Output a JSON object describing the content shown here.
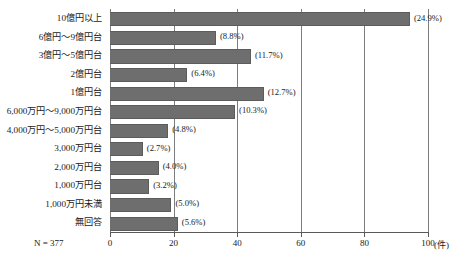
{
  "chart_data": {
    "type": "bar",
    "orientation": "horizontal",
    "title": "",
    "xlabel": "(件)",
    "ylabel": "",
    "xlim": [
      0,
      100
    ],
    "xticks": [
      "0",
      "20",
      "40",
      "60",
      "80",
      "100"
    ],
    "grid": true,
    "legend": null,
    "sample_size_note": "N = 377",
    "categories": [
      "10億円以上",
      "6億円～9億円台",
      "3億円～5億円台",
      "2億円台",
      "1億円台",
      "6,000万円～9,000万円台",
      "4,000万円～5,000万円台",
      "3,000万円台",
      "2,000万円台",
      "1,000万円台",
      "1,000万円未満",
      "無回答"
    ],
    "values": [
      94,
      33,
      44,
      24,
      48,
      39,
      18,
      10,
      15,
      12,
      19,
      21
    ],
    "percent_labels": [
      "(24.9%)",
      "(8.8%)",
      "(11.7%)",
      "(6.4%)",
      "(12.7%)",
      "(10.3%)",
      "(4.8%)",
      "(2.7%)",
      "(4.0%)",
      "(3.2%)",
      "(5.0%)",
      "(5.6%)"
    ],
    "percents": [
      24.9,
      8.8,
      11.7,
      6.4,
      12.7,
      10.3,
      4.8,
      2.7,
      4.0,
      3.2,
      5.0,
      5.6
    ],
    "colors": {
      "bar_fill": "#6e6e6e",
      "bar_stroke": "#5c5c5c",
      "gridline": "#7d7d7d",
      "axis": "#5a5a5a",
      "text": "#1a1a1a",
      "background": "#ffffff"
    }
  }
}
